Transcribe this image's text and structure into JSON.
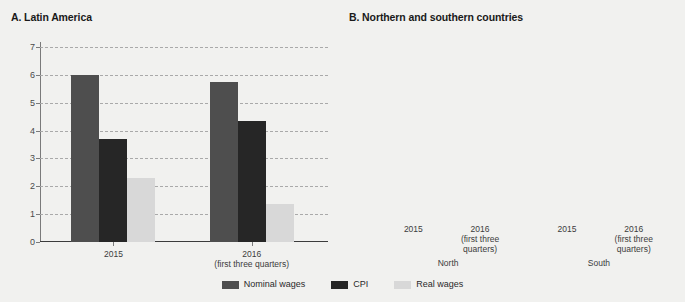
{
  "chart_data": [
    {
      "type": "bar",
      "panel": "A",
      "title": "A. Latin America",
      "xlabel": "",
      "ylabel": "",
      "ylim": [
        0,
        7
      ],
      "yticks": [
        "0",
        "1",
        "2",
        "3",
        "4",
        "5",
        "6",
        "7"
      ],
      "grid": true,
      "categories": [
        "2015",
        "2016\n(first three quarters)"
      ],
      "legend_position": "bottom",
      "series": [
        {
          "name": "Nominal wages",
          "color": "#4e4e4e",
          "values": [
            6.0,
            5.75
          ]
        },
        {
          "name": "CPI",
          "color": "#262626",
          "values": [
            3.7,
            4.35
          ]
        },
        {
          "name": "Real wages",
          "color": "#d8d8d8",
          "values": [
            2.3,
            1.35
          ]
        }
      ]
    },
    {
      "type": "bar",
      "panel": "B",
      "title": "B. Northern and southern countries",
      "xlabel": "",
      "ylabel": "",
      "ylim": [
        -1,
        9
      ],
      "yticks": [
        "-1",
        "0",
        "1",
        "2",
        "3",
        "4",
        "5",
        "6",
        "7",
        "8",
        "9"
      ],
      "grid": true,
      "categories": [
        "2015",
        "2016\n(first three\nquarters)",
        "2015",
        "2016\n(first three\nquarters)"
      ],
      "group_labels": [
        "North",
        "South"
      ],
      "legend_position": "bottom",
      "series": [
        {
          "name": "Nominal wages",
          "color": "#4e4e4e",
          "values": [
            5.0,
            4.35,
            7.3,
            7.6
          ]
        },
        {
          "name": "CPI",
          "color": "#262626",
          "values": [
            1.25,
            1.75,
            6.65,
            7.85
          ]
        },
        {
          "name": "Real wages",
          "color": "#d8d8d8",
          "values": [
            3.7,
            2.6,
            0.65,
            0.0
          ]
        }
      ]
    }
  ],
  "legend": {
    "items": [
      {
        "label": "Nominal wages",
        "key": "nominal"
      },
      {
        "label": "CPI",
        "key": "cpi"
      },
      {
        "label": "Real wages",
        "key": "real"
      }
    ]
  },
  "panel_a": {
    "title": "A. Latin America",
    "yticks": [
      "7",
      "6",
      "5",
      "4",
      "3",
      "2",
      "1",
      "0"
    ],
    "xlabels": [
      "2015",
      "2016\n(first three quarters)"
    ]
  },
  "panel_b": {
    "title": "B. Northern and southern countries",
    "yticks": [
      "9",
      "8",
      "7",
      "6",
      "5",
      "4",
      "3",
      "2",
      "1",
      "0",
      "-1"
    ],
    "xlabels": [
      "2015",
      "2016\n(first three\nquarters)",
      "2015",
      "2016\n(first three\nquarters)"
    ],
    "group_labels": [
      "North",
      "South"
    ]
  }
}
